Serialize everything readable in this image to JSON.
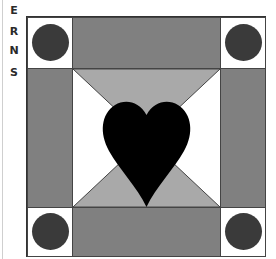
{
  "side_letters": [
    "E",
    "R",
    "N",
    "S"
  ],
  "quilt_block": {
    "pattern": "heart-in-square quilt block",
    "corner_squares": 4,
    "side_bands": 4,
    "center_motif": "heart",
    "colors": {
      "border": "#333333",
      "band": "#808080",
      "triangle": "#a9a9a9",
      "dot": "#3a3a3a",
      "heart": "#000000",
      "background": "#ffffff"
    }
  }
}
